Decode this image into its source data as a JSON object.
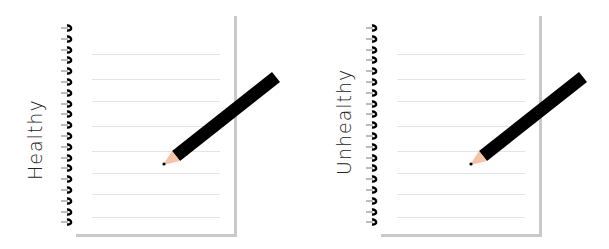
{
  "panels": [
    {
      "label": "Healthy"
    },
    {
      "label": "Unhealthy"
    }
  ],
  "notebook": {
    "ring_count": 19,
    "ruled_line_count": 8,
    "colors": {
      "ring": "#000000",
      "ring_wire": "#bdbdbd",
      "rule": "#e4e4e4",
      "shadow": "#c9c9c9",
      "pencil_body": "#000000",
      "pencil_wood": "#f4c4a4"
    }
  }
}
